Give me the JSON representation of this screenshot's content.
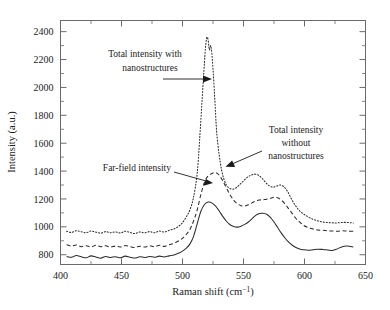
{
  "chart_data": {
    "type": "line",
    "title": "",
    "xlabel": "Raman shift (cm−1)",
    "ylabel": "Intensity (a.u.)",
    "xlim": [
      400,
      650
    ],
    "ylim": [
      730,
      2480
    ],
    "xticks": [
      400,
      450,
      500,
      550,
      600,
      650
    ],
    "xtick_labels": [
      "400",
      "450",
      "500",
      "550",
      "600",
      "650"
    ],
    "yticks": [
      800,
      1000,
      1200,
      1400,
      1600,
      1800,
      2000,
      2200,
      2400
    ],
    "ytick_labels": [
      "800",
      "1000",
      "1200",
      "1400",
      "1600",
      "1800",
      "2000",
      "2200",
      "2400"
    ],
    "grid": false,
    "legend_position": "inline-annotations",
    "series": [
      {
        "name": "Total intensity with nanostructures",
        "style": "dotted",
        "x": [
          405,
          409,
          413,
          417,
          421,
          425,
          429,
          433,
          437,
          441,
          445,
          449,
          453,
          457,
          461,
          465,
          469,
          473,
          477,
          481,
          485,
          489,
          493,
          497,
          500,
          503,
          506,
          509,
          512,
          514,
          516,
          518,
          519,
          520,
          521,
          522,
          523,
          524,
          525,
          526,
          527,
          528,
          530,
          532,
          534,
          536,
          538,
          541,
          544,
          547,
          550,
          553,
          556,
          559,
          562,
          565,
          568,
          571,
          574,
          577,
          580,
          583,
          586,
          589,
          592,
          595,
          598,
          601,
          605,
          609,
          613,
          617,
          621,
          625,
          629,
          633,
          637,
          640
        ],
        "y": [
          968,
          960,
          972,
          965,
          958,
          970,
          962,
          955,
          966,
          958,
          964,
          956,
          968,
          960,
          952,
          963,
          957,
          966,
          958,
          970,
          963,
          975,
          985,
          1005,
          1030,
          1070,
          1120,
          1210,
          1380,
          1620,
          1900,
          2180,
          2300,
          2360,
          2340,
          2270,
          2300,
          2250,
          2130,
          1990,
          1830,
          1680,
          1520,
          1410,
          1340,
          1300,
          1280,
          1270,
          1280,
          1305,
          1330,
          1355,
          1370,
          1378,
          1372,
          1350,
          1320,
          1295,
          1285,
          1292,
          1300,
          1288,
          1255,
          1205,
          1160,
          1125,
          1100,
          1082,
          1062,
          1048,
          1038,
          1032,
          1030,
          1028,
          1030,
          1032,
          1030,
          1028
        ]
      },
      {
        "name": "Total intensity without nanostructures",
        "style": "dashed",
        "x": [
          405,
          409,
          413,
          417,
          421,
          425,
          429,
          433,
          437,
          441,
          445,
          449,
          453,
          457,
          461,
          465,
          469,
          473,
          477,
          481,
          485,
          489,
          493,
          497,
          500,
          503,
          506,
          509,
          512,
          515,
          518,
          521,
          524,
          527,
          530,
          533,
          536,
          539,
          542,
          545,
          548,
          551,
          554,
          557,
          560,
          563,
          566,
          569,
          572,
          575,
          578,
          581,
          584,
          587,
          590,
          593,
          596,
          599,
          603,
          607,
          611,
          615,
          619,
          623,
          627,
          631,
          635,
          640
        ],
        "y": [
          872,
          862,
          870,
          858,
          865,
          856,
          868,
          858,
          864,
          855,
          862,
          856,
          866,
          858,
          852,
          861,
          855,
          864,
          858,
          868,
          860,
          872,
          882,
          900,
          918,
          945,
          980,
          1040,
          1120,
          1230,
          1320,
          1365,
          1382,
          1390,
          1372,
          1330,
          1280,
          1230,
          1190,
          1165,
          1152,
          1150,
          1158,
          1172,
          1185,
          1192,
          1195,
          1198,
          1205,
          1212,
          1208,
          1192,
          1165,
          1130,
          1095,
          1060,
          1035,
          1012,
          995,
          985,
          978,
          975,
          972,
          970,
          968,
          972,
          970,
          968
        ]
      },
      {
        "name": "Far-field intensity",
        "style": "solid",
        "x": [
          405,
          409,
          413,
          417,
          421,
          425,
          429,
          433,
          437,
          441,
          445,
          449,
          453,
          457,
          461,
          465,
          469,
          473,
          477,
          481,
          485,
          489,
          493,
          497,
          500,
          503,
          506,
          509,
          512,
          515,
          518,
          521,
          524,
          527,
          530,
          533,
          536,
          539,
          542,
          545,
          548,
          551,
          554,
          557,
          560,
          563,
          566,
          569,
          572,
          575,
          578,
          581,
          584,
          587,
          590,
          593,
          596,
          599,
          603,
          607,
          611,
          615,
          619,
          623,
          627,
          631,
          635,
          640
        ],
        "y": [
          788,
          782,
          795,
          786,
          778,
          792,
          783,
          775,
          788,
          780,
          786,
          778,
          790,
          782,
          776,
          786,
          780,
          788,
          782,
          790,
          784,
          792,
          798,
          812,
          826,
          846,
          876,
          930,
          1020,
          1110,
          1160,
          1178,
          1172,
          1150,
          1115,
          1075,
          1040,
          1015,
          1002,
          998,
          1005,
          1018,
          1035,
          1058,
          1082,
          1095,
          1098,
          1090,
          1068,
          1035,
          995,
          955,
          920,
          890,
          868,
          852,
          842,
          836,
          832,
          836,
          840,
          838,
          834,
          830,
          842,
          858,
          862,
          856
        ]
      }
    ],
    "annotations": [
      {
        "id": "ann-with",
        "text_lines": [
          "Total intensity with",
          "nanostructures"
        ],
        "points_to_series": "Total intensity with nanostructures"
      },
      {
        "id": "ann-without",
        "text_lines": [
          "Total intensity",
          "without",
          "nanostructures"
        ],
        "points_to_series": "Total intensity without nanostructures"
      },
      {
        "id": "ann-farfield",
        "text_lines": [
          "Far-field intensity"
        ],
        "points_to_series": "Far-field intensity"
      }
    ]
  },
  "axes": {
    "x_title": "Raman shift (cm",
    "x_title_exp": "−1",
    "x_title_tail": ")",
    "y_title": "Intensity (a.u.)"
  },
  "annotation_text": {
    "with_line1": "Total intensity with",
    "with_line2": "nanostructures",
    "without_line1": "Total intensity",
    "without_line2": "without",
    "without_line3": "nanostructures",
    "farfield": "Far-field intensity"
  },
  "colors": {
    "curve": "#2b2b2b",
    "frame": "#6a6a6a",
    "text": "#1a1a1a",
    "background": "#ffffff"
  }
}
